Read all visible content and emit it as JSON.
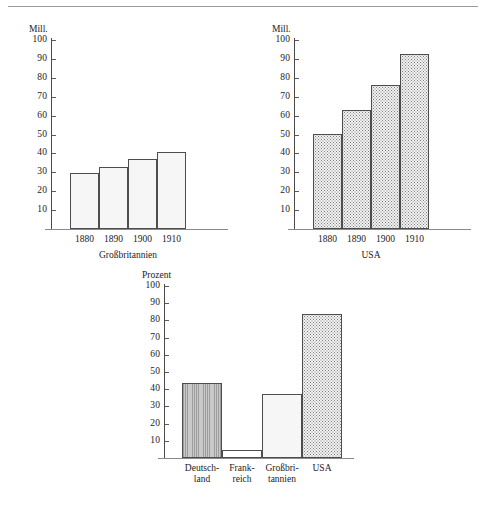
{
  "figure": {
    "rule_visible": true
  },
  "chart_data": [
    {
      "id": "grossbritannien",
      "type": "bar",
      "title": "",
      "caption": "Großbritannien",
      "ylabel": "Mill.",
      "xlabel": "",
      "categories": [
        "1880",
        "1890",
        "1900",
        "1910"
      ],
      "values": [
        29.5,
        33,
        37,
        40.5
      ],
      "ylim": [
        0,
        100
      ],
      "yticks": [
        100,
        90,
        80,
        70,
        60,
        50,
        40,
        30,
        20,
        10
      ],
      "grid": false,
      "legend": "none",
      "fill_style": "plain-light"
    },
    {
      "id": "usa",
      "type": "bar",
      "title": "",
      "caption": "USA",
      "ylabel": "Mill.",
      "xlabel": "",
      "categories": [
        "1880",
        "1890",
        "1900",
        "1910"
      ],
      "values": [
        50.5,
        63,
        76,
        92.5
      ],
      "ylim": [
        0,
        100
      ],
      "yticks": [
        100,
        90,
        80,
        70,
        60,
        50,
        40,
        30,
        20,
        10
      ],
      "grid": false,
      "legend": "none",
      "fill_style": "stipple-dots"
    },
    {
      "id": "prozent",
      "type": "bar",
      "title": "",
      "caption": "",
      "ylabel": "Prozent",
      "xlabel": "",
      "categories": [
        "Deutsch-\nland",
        "Frank-\nreich",
        "Großbri-\ntannien",
        "USA"
      ],
      "category_lines": [
        {
          "line1": "Deutsch-",
          "line2": "land"
        },
        {
          "line1": "Frank-",
          "line2": "reich"
        },
        {
          "line1": "Großbri-",
          "line2": "tannien"
        },
        {
          "line1": "USA",
          "line2": ""
        }
      ],
      "values": [
        43.5,
        4.5,
        37,
        84
      ],
      "ylim": [
        0,
        100
      ],
      "yticks": [
        100,
        90,
        80,
        70,
        60,
        50,
        40,
        30,
        20,
        10
      ],
      "grid": false,
      "legend": "none",
      "fill_style": [
        "vertical-hatch",
        "white",
        "plain-light",
        "stipple-dots"
      ]
    }
  ],
  "colors": {
    "axis": "#4a4a4a",
    "baseline": "#8a8a8a",
    "bar_outline": "#4d4d4d",
    "bar_light": "#f6f6f6",
    "bar_gray": "#c9c9c9",
    "text": "#1b1b1b",
    "rule": "#9a9a9a"
  },
  "yticks_labels": {
    "t100": "100",
    "t90": "90",
    "t80": "80",
    "t70": "70",
    "t60": "60",
    "t50": "50",
    "t40": "40",
    "t30": "30",
    "t20": "20",
    "t10": "10"
  }
}
